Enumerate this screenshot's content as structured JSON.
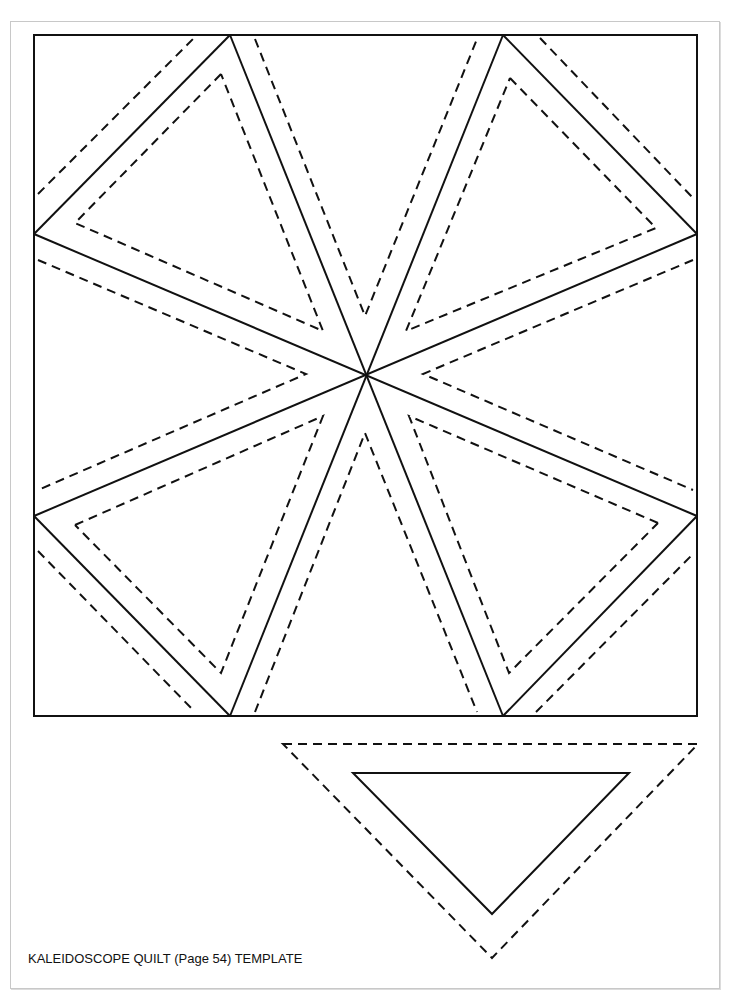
{
  "caption": "KALEIDOSCOPE QUILT (Page 54) TEMPLATE",
  "colors": {
    "line": "#111111",
    "page_border": "#c8c8c8",
    "background": "#ffffff"
  },
  "diagram": {
    "block": {
      "x": 34,
      "y": 35,
      "width": 663,
      "height": 681
    },
    "center": {
      "x": 365,
      "y": 374
    },
    "cut_lines": "solid",
    "seam_allowance_lines": "dashed",
    "template_piece": {
      "outer_dashed": [
        [
          283,
          744
        ],
        [
          698,
          744
        ],
        [
          492,
          958
        ]
      ],
      "inner_solid": [
        [
          353,
          773
        ],
        [
          629,
          773
        ],
        [
          492,
          914
        ]
      ]
    }
  }
}
